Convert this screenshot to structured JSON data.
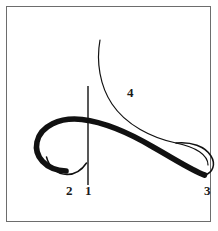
{
  "figure": {
    "kind": "stroke-order-diagram",
    "background_color": "#ffffff",
    "frame": {
      "border_color": "#6d6d6d",
      "x": 6,
      "y": 6,
      "width": 205,
      "height": 216
    },
    "ink_color": "#111111",
    "labels": [
      {
        "id": "label-1",
        "text": "1",
        "x": 85,
        "y": 184
      },
      {
        "id": "label-2",
        "text": "2",
        "x": 66,
        "y": 184
      },
      {
        "id": "label-3",
        "text": "3",
        "x": 204,
        "y": 184
      },
      {
        "id": "label-4",
        "text": "4",
        "x": 127,
        "y": 86
      }
    ],
    "strokes": [
      {
        "id": "thin-descending-curve",
        "name": "thin-upper-curve",
        "width": 1.2,
        "path": "M 100 40 C 96 62, 100 86, 112 104 C 126 125, 152 138, 176 143 C 196 147, 208 155, 208 165"
      },
      {
        "id": "vertical-axis-line",
        "name": "vertical-stem",
        "width": 1.3,
        "path": "M 88 86 L 88 185"
      },
      {
        "id": "thick-s-stroke",
        "name": "thick-main-stroke",
        "width": 5.6,
        "path": "M 70 172 C 48 172, 36 158, 38 144 C 40 128, 58 118, 80 120 C 104 122, 130 134, 152 146 C 174 158, 192 170, 204 174"
      },
      {
        "id": "thin-lower-hook",
        "name": "thin-inner-hook",
        "width": 1.4,
        "path": "M 47 158 C 50 168, 58 175, 68 175 C 76 175, 82 170, 86 164"
      },
      {
        "id": "right-loop-return",
        "name": "right-loop-return-curve",
        "width": 1.4,
        "path": "M 204 174 C 212 172, 214 164, 210 157 C 204 147, 190 142, 176 143"
      }
    ]
  }
}
